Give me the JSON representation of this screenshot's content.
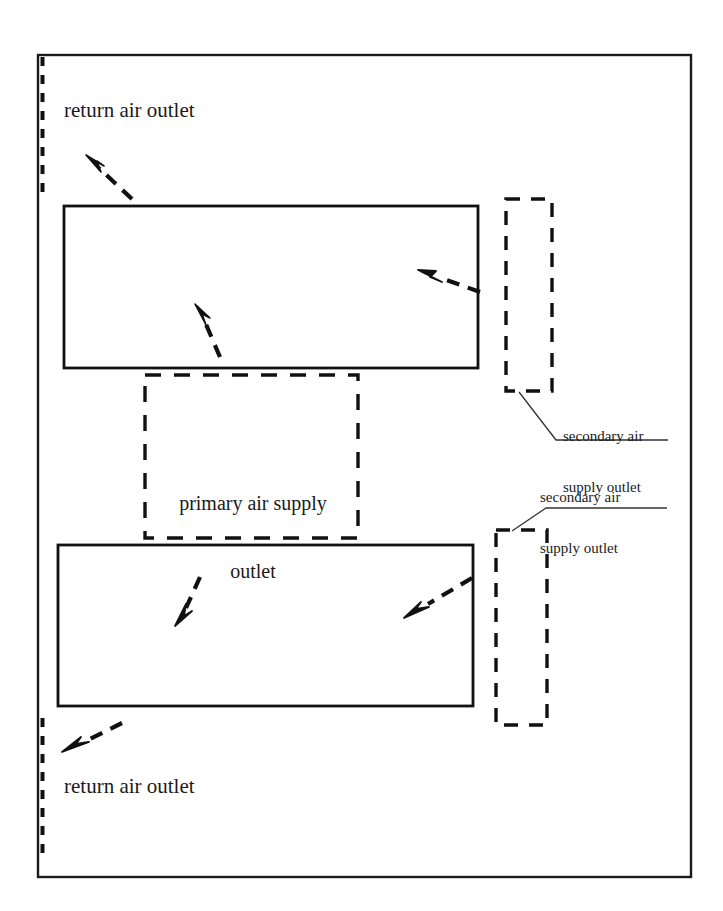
{
  "diagram": {
    "stroke_color": "#1a1a1a",
    "background_color": "#ffffff",
    "labels": {
      "return_air_outlet_top": "return air outlet",
      "return_air_outlet_bottom": "return air outlet",
      "primary_air_supply_outlet_line1": "primary air supply",
      "primary_air_supply_outlet_line2": "outlet",
      "secondary_air_supply_outlet_1_line1": "secondary air",
      "secondary_air_supply_outlet_1_line2": "supply outlet",
      "secondary_air_supply_outlet_2_line1": "secondary air",
      "secondary_air_supply_outlet_2_line2": "supply outlet"
    },
    "elements": {
      "outer_frame": "room-boundary-rectangle",
      "return_outlet_top": "left-wall-dashed-segment-upper",
      "return_outlet_bottom": "left-wall-dashed-segment-lower",
      "upper_zone": "solid-rectangle-upper",
      "lower_zone": "solid-rectangle-lower",
      "primary_outlet": "dashed-rectangle-center",
      "secondary_outlet_upper": "dashed-rectangle-right-upper",
      "secondary_outlet_lower": "dashed-rectangle-right-lower",
      "arrows": [
        "arrow-up-left-to-return-top",
        "arrow-up-into-upper-zone",
        "arrow-left-into-upper-zone",
        "arrow-down-left-in-lower-zone",
        "arrow-down-left-into-lower-zone",
        "arrow-down-left-to-return-bottom"
      ],
      "leader_lines": [
        "leader-secondary-upper",
        "leader-secondary-lower"
      ]
    }
  }
}
